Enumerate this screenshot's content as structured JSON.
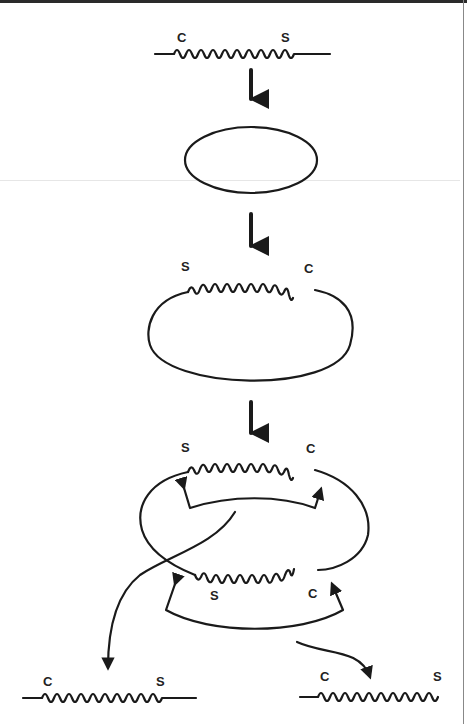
{
  "diagram": {
    "type": "process-flow",
    "stages": [
      {
        "id": "stage-1-linear",
        "labels": {
          "left": "C",
          "right": "S"
        }
      },
      {
        "id": "stage-2-circle",
        "labels": {}
      },
      {
        "id": "stage-3-circle-with-insert",
        "labels": {
          "left": "S",
          "right": "C"
        }
      },
      {
        "id": "stage-4-double-insert",
        "labels": {
          "top_left": "S",
          "top_right": "C",
          "bottom_left": "S",
          "bottom_right": "C"
        }
      },
      {
        "id": "stage-5-product-left",
        "labels": {
          "left": "C",
          "right": "S"
        }
      },
      {
        "id": "stage-5-product-right",
        "labels": {
          "left": "C",
          "right": "S"
        }
      }
    ],
    "colors": {
      "line": "#1a1a1a",
      "background": "#ffffff"
    }
  }
}
